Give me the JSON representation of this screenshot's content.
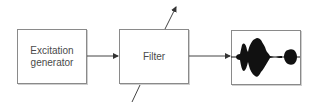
{
  "diagram": {
    "type": "block-diagram",
    "blocks": [
      {
        "id": "excitation",
        "label_line1": "Excitation",
        "label_line2": "generator"
      },
      {
        "id": "filter",
        "label": "Filter"
      },
      {
        "id": "output",
        "label": "",
        "content": "speech waveform"
      }
    ],
    "connections": [
      {
        "from": "excitation",
        "to": "filter",
        "arrow": true
      },
      {
        "from": "filter",
        "to": "output",
        "arrow": true
      }
    ],
    "filter_parameter_arrow": {
      "direction": "diagonal through filter, bottom-left to top-right",
      "meaning": "time-varying filter parameters"
    },
    "colors": {
      "line": "#555555",
      "box_border": "#8a8a8a",
      "text": "#4a4a4a",
      "waveform": "#111111"
    }
  }
}
